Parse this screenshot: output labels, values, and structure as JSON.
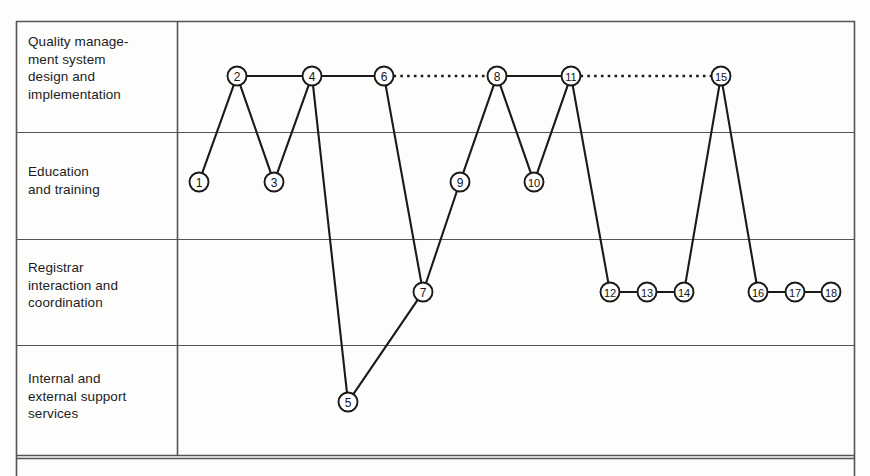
{
  "diagram": {
    "background_color": "#fdfdfc",
    "line_color": "#1a1a1a",
    "grid_color": "#555555",
    "node_fill": "#ffffff",
    "rows": [
      {
        "id": "row-qms",
        "label": "Quality manage-\nment system\ndesign and\nimplementation",
        "top": 21,
        "bottom": 132
      },
      {
        "id": "row-education",
        "label": "Education\nand training",
        "top": 132,
        "bottom": 239
      },
      {
        "id": "row-registrar",
        "label": "Registrar\ninteraction and\ncoordination",
        "top": 239,
        "bottom": 345
      },
      {
        "id": "row-support",
        "label": "Internal and\nexternal support\nservices",
        "top": 345,
        "bottom": 455
      },
      {
        "id": "row-partial",
        "label": "",
        "top": 458,
        "bottom": 476
      }
    ]
  },
  "chart_data": {
    "type": "scatter",
    "xlabel": "",
    "ylabel": "Activity category",
    "grid": true,
    "legend": "none",
    "categories": [
      "Quality management system design and implementation",
      "Education and training",
      "Registrar interaction and coordination",
      "Internal and external support services"
    ],
    "row_y": {
      "qms": 76,
      "education": 182,
      "registrar": 292,
      "support": 402
    },
    "nodes": [
      {
        "id": 1,
        "label": "1",
        "x": 199,
        "y": 182,
        "row": "education"
      },
      {
        "id": 2,
        "label": "2",
        "x": 237,
        "y": 76,
        "row": "qms"
      },
      {
        "id": 3,
        "label": "3",
        "x": 274,
        "y": 182,
        "row": "education"
      },
      {
        "id": 4,
        "label": "4",
        "x": 312,
        "y": 76,
        "row": "qms"
      },
      {
        "id": 5,
        "label": "5",
        "x": 348,
        "y": 402,
        "row": "support"
      },
      {
        "id": 6,
        "label": "6",
        "x": 384,
        "y": 76,
        "row": "qms"
      },
      {
        "id": 7,
        "label": "7",
        "x": 423,
        "y": 292,
        "row": "registrar"
      },
      {
        "id": 8,
        "label": "8",
        "x": 497,
        "y": 76,
        "row": "qms"
      },
      {
        "id": 9,
        "label": "9",
        "x": 460,
        "y": 182,
        "row": "education"
      },
      {
        "id": 10,
        "label": "10",
        "x": 534,
        "y": 182,
        "row": "education"
      },
      {
        "id": 11,
        "label": "11",
        "x": 571,
        "y": 76,
        "row": "qms"
      },
      {
        "id": 12,
        "label": "12",
        "x": 610,
        "y": 292,
        "row": "registrar"
      },
      {
        "id": 13,
        "label": "13",
        "x": 647,
        "y": 292,
        "row": "registrar"
      },
      {
        "id": 14,
        "label": "14",
        "x": 684,
        "y": 292,
        "row": "registrar"
      },
      {
        "id": 15,
        "label": "15",
        "x": 721,
        "y": 76,
        "row": "qms"
      },
      {
        "id": 16,
        "label": "16",
        "x": 758,
        "y": 292,
        "row": "registrar"
      },
      {
        "id": 17,
        "label": "17",
        "x": 795,
        "y": 292,
        "row": "registrar"
      },
      {
        "id": 18,
        "label": "18",
        "x": 831,
        "y": 292,
        "row": "registrar"
      }
    ],
    "edges": [
      {
        "from": 1,
        "to": 2,
        "style": "solid"
      },
      {
        "from": 2,
        "to": 3,
        "style": "solid"
      },
      {
        "from": 2,
        "to": 4,
        "style": "solid"
      },
      {
        "from": 3,
        "to": 4,
        "style": "solid"
      },
      {
        "from": 4,
        "to": 5,
        "style": "solid"
      },
      {
        "from": 4,
        "to": 6,
        "style": "solid"
      },
      {
        "from": 5,
        "to": 7,
        "style": "solid"
      },
      {
        "from": 6,
        "to": 7,
        "style": "solid"
      },
      {
        "from": 6,
        "to": 8,
        "style": "dotted"
      },
      {
        "from": 7,
        "to": 9,
        "style": "solid"
      },
      {
        "from": 9,
        "to": 8,
        "style": "solid"
      },
      {
        "from": 8,
        "to": 10,
        "style": "solid"
      },
      {
        "from": 8,
        "to": 11,
        "style": "solid"
      },
      {
        "from": 10,
        "to": 11,
        "style": "solid"
      },
      {
        "from": 11,
        "to": 12,
        "style": "solid"
      },
      {
        "from": 11,
        "to": 15,
        "style": "dotted"
      },
      {
        "from": 12,
        "to": 13,
        "style": "solid"
      },
      {
        "from": 13,
        "to": 14,
        "style": "solid"
      },
      {
        "from": 14,
        "to": 15,
        "style": "solid"
      },
      {
        "from": 15,
        "to": 16,
        "style": "solid"
      },
      {
        "from": 16,
        "to": 17,
        "style": "solid"
      },
      {
        "from": 17,
        "to": 18,
        "style": "solid"
      }
    ],
    "node_radius": 9.5,
    "plot_area": {
      "left": 177,
      "right": 855,
      "top": 21,
      "bottom": 455
    },
    "frame": {
      "left": 16,
      "right": 855,
      "top": 21,
      "bottom": 455
    }
  }
}
